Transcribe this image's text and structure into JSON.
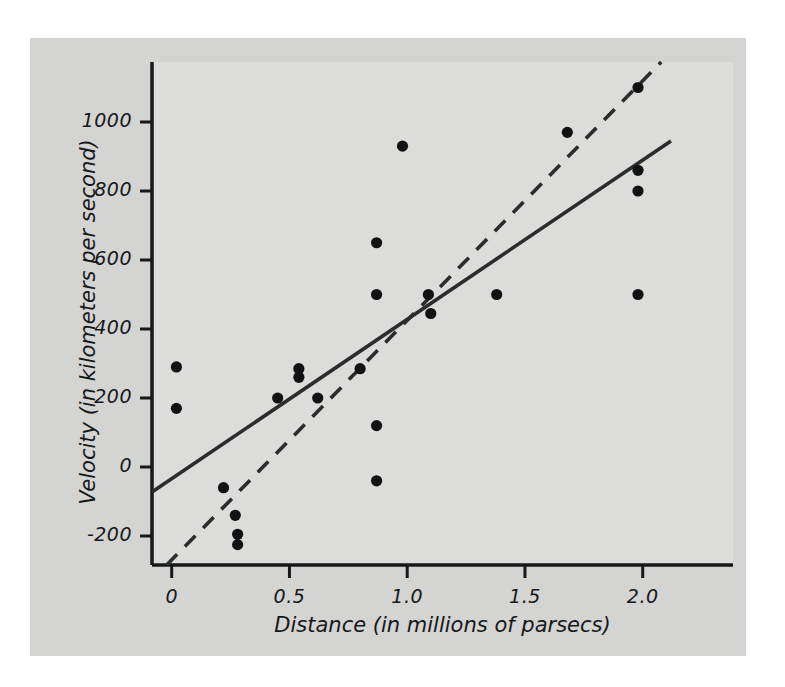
{
  "chart_data": {
    "type": "scatter",
    "title": "",
    "xlabel": "Distance (in millions of parsecs)",
    "ylabel": "Velocity (in kilometers per second)",
    "xlim": [
      -0.1,
      2.15
    ],
    "ylim": [
      -290,
      1180
    ],
    "xticks": [
      0,
      0.5,
      1.0,
      1.5,
      2.0
    ],
    "xticklabels": [
      "0",
      "0.5",
      "1.0",
      "1.5",
      "2.0"
    ],
    "yticks": [
      -200,
      0,
      200,
      400,
      600,
      800,
      1000
    ],
    "yticklabels": [
      "-200",
      "0",
      "200",
      "400",
      "600",
      "800",
      "1000"
    ],
    "grid": false,
    "legend": null,
    "legend_position": "none",
    "marker": "filled-circle",
    "marker_color": "#101214",
    "points": [
      {
        "x": 0.02,
        "y": 290
      },
      {
        "x": 0.02,
        "y": 170
      },
      {
        "x": 0.22,
        "y": -60
      },
      {
        "x": 0.27,
        "y": -140
      },
      {
        "x": 0.28,
        "y": -195
      },
      {
        "x": 0.28,
        "y": -225
      },
      {
        "x": 0.45,
        "y": 200
      },
      {
        "x": 0.54,
        "y": 285
      },
      {
        "x": 0.54,
        "y": 260
      },
      {
        "x": 0.62,
        "y": 200
      },
      {
        "x": 0.8,
        "y": 285
      },
      {
        "x": 0.87,
        "y": 650
      },
      {
        "x": 0.87,
        "y": 500
      },
      {
        "x": 0.87,
        "y": 120
      },
      {
        "x": 0.87,
        "y": -40
      },
      {
        "x": 0.98,
        "y": 930
      },
      {
        "x": 1.09,
        "y": 500
      },
      {
        "x": 1.1,
        "y": 445
      },
      {
        "x": 1.38,
        "y": 500
      },
      {
        "x": 1.68,
        "y": 970
      },
      {
        "x": 1.98,
        "y": 1100
      },
      {
        "x": 1.98,
        "y": 860
      },
      {
        "x": 1.98,
        "y": 800
      },
      {
        "x": 1.98,
        "y": 500
      }
    ],
    "lines": [
      {
        "name": "solid-regression-line",
        "style": "solid",
        "color": "#2a2c2e",
        "x0": -0.1,
        "y0": -80,
        "x1": 2.12,
        "y1": 945
      },
      {
        "name": "dashed-regression-line",
        "style": "dashed",
        "color": "#2a2c2e",
        "x0": -0.03,
        "y0": -290,
        "x1": 2.08,
        "y1": 1175
      }
    ]
  },
  "axes": {
    "x_title": "Distance (in millions of parsecs)",
    "y_title": "Velocity (in kilometers per second)",
    "x_tick_labels": [
      "0",
      "0.5",
      "1.0",
      "1.5",
      "2.0"
    ],
    "y_tick_labels": [
      "1000",
      "800",
      "600",
      "400",
      "200",
      "0",
      "-200"
    ]
  },
  "colors": {
    "panel_background": "#d4d4d2",
    "plot_background": "#dcdcda",
    "axis": "#16181a",
    "marker": "#101214",
    "line": "#2a2c2e",
    "page_background": "#ffffff"
  }
}
